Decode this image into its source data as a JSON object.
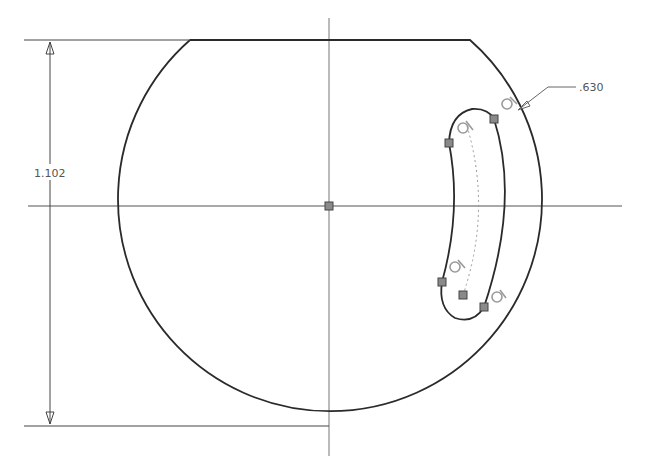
{
  "sketch": {
    "colors": {
      "background": "#ffffff",
      "geometry": "#2a2a2a",
      "axis": "#6a6a6a",
      "dimension": "#444444",
      "constraint": "#9a9a9a",
      "point_fill": "#8a8a8a"
    },
    "dimensions": {
      "vertical_height": {
        "label": "1.102"
      },
      "slot_offset": {
        "label": ".630"
      }
    },
    "origin_point": {
      "label": "origin"
    }
  }
}
